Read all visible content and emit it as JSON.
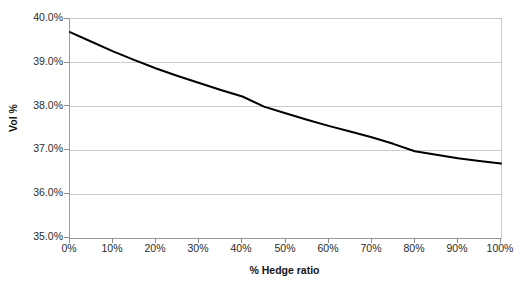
{
  "chart_data": {
    "type": "line",
    "title": "",
    "subtitle": "",
    "xlabel": "% Hedge ratio",
    "ylabel": "Vol %",
    "xlim": [
      0,
      100
    ],
    "ylim": [
      35.0,
      40.0
    ],
    "grid": "horizontal",
    "legend": "none",
    "x_tick_labels": [
      "0%",
      "10%",
      "20%",
      "30%",
      "40%",
      "50%",
      "60%",
      "70%",
      "80%",
      "90%",
      "100%"
    ],
    "x_tick_values": [
      0,
      10,
      20,
      30,
      40,
      50,
      60,
      70,
      80,
      90,
      100
    ],
    "y_tick_labels": [
      "40.0%",
      "39.0%",
      "38.0%",
      "37.0%",
      "36.0%",
      "35.0%"
    ],
    "y_tick_values": [
      40.0,
      39.0,
      38.0,
      37.0,
      36.0,
      35.0
    ],
    "series": [
      {
        "name": "Vol %",
        "color": "#000000",
        "line_width": 2,
        "x": [
          0,
          5,
          10,
          15,
          20,
          25,
          30,
          35,
          40,
          45,
          50,
          55,
          60,
          65,
          70,
          75,
          80,
          85,
          90,
          95,
          100
        ],
        "values": [
          39.7,
          39.48,
          39.26,
          39.06,
          38.87,
          38.7,
          38.54,
          38.38,
          38.23,
          38.0,
          37.85,
          37.7,
          37.56,
          37.43,
          37.3,
          37.15,
          36.98,
          36.9,
          36.82,
          36.76,
          36.7
        ]
      }
    ]
  },
  "colors": {
    "series_line": "#000000",
    "gridline": "#cccccc",
    "axis_line": "#9a9a9a",
    "plot_background": "#ffffff",
    "text": "#2b2b2b"
  }
}
